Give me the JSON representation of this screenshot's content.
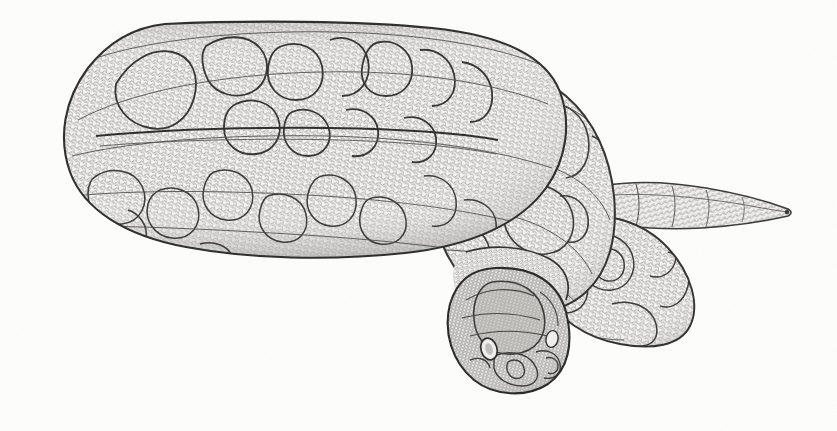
{
  "figure": {
    "domain": "Natural-Image",
    "kind": "scientific-line-illustration",
    "subject": "snake",
    "subject_common_name": "Coiled snake",
    "pose": "coiled resting with head resting on forward coil, tail extended to the right",
    "medium": "pen-and-ink stipple / scale-reticulation drawing",
    "title": "",
    "caption": "",
    "credit": "",
    "has_visible_text": false,
    "canvas": {
      "width": 837,
      "height": 431
    },
    "background_color": "#fdfdfc",
    "ink_color": "#5a5a5a",
    "outline_color": "#2f2f2f",
    "blotch_outline_color": "#3a3a3a",
    "scale_fill_light": "#f2f1ef",
    "shadow_gray": "#b9b8b6"
  },
  "anatomy": {
    "parts": [
      {
        "name": "main-body-coil",
        "label": "Large outer body coil",
        "bbox": [
          62,
          22,
          560,
          260
        ],
        "note": "Largest loop occupying the left two thirds; flattened oval with dorsal saddle blotches"
      },
      {
        "name": "upper-dorsal-ridge",
        "label": "Upper dorsal ridge of outer coil",
        "bbox": [
          90,
          22,
          470,
          130
        ],
        "note": "Top surface showing dark-edged dorsal blotches in a row"
      },
      {
        "name": "lateral-flank",
        "label": "Lateral flank of outer coil",
        "bbox": [
          70,
          120,
          420,
          140
        ],
        "note": "Side face below the horizontal body crease line"
      },
      {
        "name": "body-crease-line",
        "label": "Horizontal crease separating dorsum from flank",
        "bbox": [
          100,
          128,
          380,
          6
        ]
      },
      {
        "name": "second-coil",
        "label": "Second inner coil (right of main loop)",
        "bbox": [
          430,
          70,
          200,
          230
        ]
      },
      {
        "name": "third-coil",
        "label": "Third coil loop at lower right",
        "bbox": [
          540,
          215,
          165,
          130
        ]
      },
      {
        "name": "tail",
        "label": "Tapering tail",
        "bbox": [
          600,
          178,
          192,
          55
        ],
        "note": "Extends to the right and tapers to a fine point near x=790"
      },
      {
        "name": "tail-tip",
        "label": "Tail tip",
        "bbox": [
          770,
          205,
          22,
          12
        ]
      },
      {
        "name": "head",
        "label": "Head resting on coil",
        "bbox": [
          443,
          268,
          125,
          125
        ],
        "note": "Triangular-rounded head, fine granular crown scales, eye and rostral plates visible"
      },
      {
        "name": "eye",
        "label": "Eye",
        "bbox": [
          482,
          338,
          18,
          22
        ]
      },
      {
        "name": "second-eye-hint",
        "label": "Far eye (partially visible)",
        "bbox": [
          546,
          330,
          14,
          18
        ]
      },
      {
        "name": "snout-plates",
        "label": "Rostral / labial scale plates on snout",
        "bbox": [
          495,
          352,
          70,
          38
        ]
      },
      {
        "name": "neck",
        "label": "Neck joining head to coil",
        "bbox": [
          470,
          255,
          95,
          45
        ]
      }
    ],
    "markings": {
      "pattern_type": "dorsal saddle blotches",
      "blotch_count_visible": 11,
      "description": "Dark-outlined irregular dorsal blotches along the back, becoming smaller lateral spots on the flank"
    },
    "scale_texture": {
      "type": "reticulate keeled scales",
      "cell_size_px": 6,
      "description": "Dense net of small rounded scales covering the whole animal"
    }
  },
  "palette": {
    "background": "#fdfdfc",
    "ink_light": "#8a8987",
    "ink_mid": "#5a5a5a",
    "ink_dark": "#2f2f2f",
    "scale_fill": "#f4f3f1",
    "shade": "#c9c8c6"
  },
  "chart_data": null
}
